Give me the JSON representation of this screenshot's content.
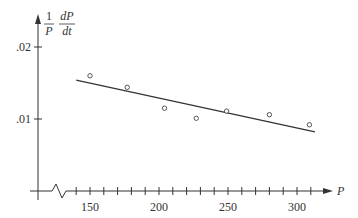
{
  "chart_data": {
    "type": "scatter",
    "title": "",
    "xlabel": "P",
    "ylabel": "(1/P) dP/dt",
    "ylabel_parts": {
      "num1": "1",
      "den1": "P",
      "num2": "dP",
      "den2": "dt"
    },
    "x_ticks": [
      150,
      200,
      250,
      300
    ],
    "x_tick_labels": [
      "150",
      "200",
      "250",
      "300"
    ],
    "x_minor_tick_step": 10,
    "y_ticks": [
      0.01,
      0.02
    ],
    "y_tick_labels": [
      ".01",
      ".02"
    ],
    "axis_break_on_x": true,
    "xlim": [
      130,
      320
    ],
    "ylim": [
      0,
      0.022
    ],
    "grid": false,
    "series": [
      {
        "name": "data",
        "marker": "open-circle",
        "points": [
          {
            "x": 150,
            "y": 0.016
          },
          {
            "x": 177,
            "y": 0.0144
          },
          {
            "x": 204,
            "y": 0.0115
          },
          {
            "x": 227,
            "y": 0.0101
          },
          {
            "x": 249,
            "y": 0.0111
          },
          {
            "x": 280,
            "y": 0.0106
          },
          {
            "x": 309,
            "y": 0.0092
          }
        ]
      },
      {
        "name": "fit line",
        "type": "line",
        "points": [
          {
            "x": 140,
            "y": 0.0154
          },
          {
            "x": 313,
            "y": 0.0082
          }
        ]
      }
    ]
  }
}
